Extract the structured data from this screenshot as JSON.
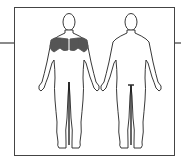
{
  "diagram": {
    "title": "Muscle map",
    "views": [
      {
        "name": "Front view",
        "highlighted": [
          "deltoids",
          "pectorals"
        ]
      },
      {
        "name": "Back view",
        "highlighted": []
      }
    ],
    "colors": {
      "outline": "#222222",
      "highlight": "#555555",
      "frame": "#444444",
      "connector": "#8a8a8a"
    }
  }
}
